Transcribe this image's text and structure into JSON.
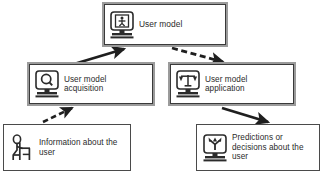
{
  "diagram": {
    "colors": {
      "box_outer_border": "#9b9b9b",
      "box_inner_border": "#3a3a3a",
      "box_fill": "#ffffff",
      "text": "#2b2b2b",
      "arrow": "#1f1f1f"
    },
    "nodes": [
      {
        "id": "user-model",
        "label": "User model",
        "icon": "monitor-person-icon",
        "border_style": "thick"
      },
      {
        "id": "acquisition",
        "label": "User model\nacquisition",
        "icon": "monitor-magnifier-icon",
        "border_style": "thick"
      },
      {
        "id": "application",
        "label": "User model\napplication",
        "icon": "monitor-scales-icon",
        "border_style": "thick"
      },
      {
        "id": "information",
        "label": "Information about the\nuser",
        "icon": "person-at-desk-icon",
        "border_style": "thin"
      },
      {
        "id": "predictions",
        "label": "Predictions or\ndecisions about the\nuser",
        "icon": "monitor-branching-arrow-icon",
        "border_style": "thin"
      }
    ],
    "edges": [
      {
        "id": "information-to-acquisition",
        "from": "information",
        "to": "acquisition",
        "style": "dashed"
      },
      {
        "id": "acquisition-to-user-model",
        "from": "acquisition",
        "to": "user-model",
        "style": "solid"
      },
      {
        "id": "user-model-to-application",
        "from": "user-model",
        "to": "application",
        "style": "dashed"
      },
      {
        "id": "application-to-predictions",
        "from": "application",
        "to": "predictions",
        "style": "solid"
      }
    ]
  }
}
